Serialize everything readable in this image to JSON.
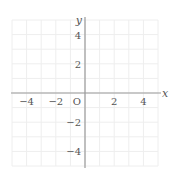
{
  "chart_data": {
    "type": "scatter",
    "title": "",
    "xlabel": "x",
    "ylabel": "y",
    "origin_label": "O",
    "xlim": [
      -5,
      5
    ],
    "ylim": [
      -5,
      5
    ],
    "grid": true,
    "grid_step": 1,
    "x_ticks": [
      {
        "value": -4,
        "label": "−4"
      },
      {
        "value": -2,
        "label": "−2"
      },
      {
        "value": 2,
        "label": "2"
      },
      {
        "value": 4,
        "label": "4"
      }
    ],
    "y_ticks": [
      {
        "value": 4,
        "label": "4"
      },
      {
        "value": 2,
        "label": "2"
      },
      {
        "value": -2,
        "label": "−2"
      },
      {
        "value": -4,
        "label": "−4"
      }
    ],
    "series": [],
    "colors": {
      "axis": "#9a9a9a",
      "grid": "#eeeeee",
      "text": "#555555"
    }
  }
}
